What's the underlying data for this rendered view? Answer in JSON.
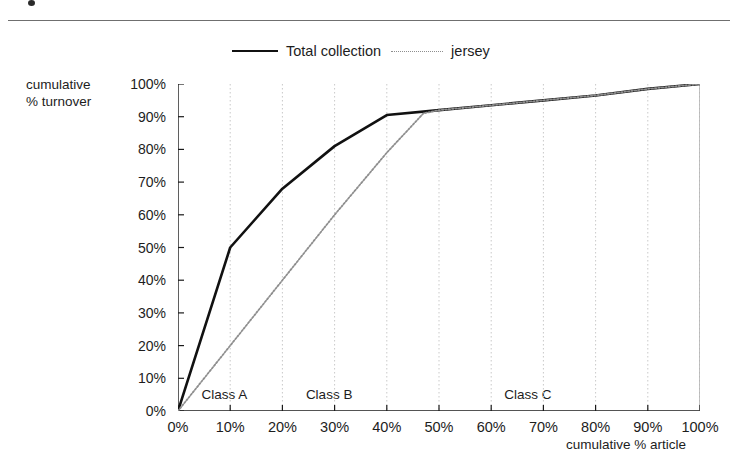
{
  "figure": {
    "ytitle_line1": "cumulative",
    "ytitle_line2": "% turnover",
    "xtitle": "cumulative % article"
  },
  "legend": {
    "items": [
      {
        "label": "Total collection",
        "style": "solid",
        "color": "#111111"
      },
      {
        "label": "jersey",
        "style": "dotted",
        "color": "#8e8e8e"
      }
    ]
  },
  "annotations": [
    {
      "label": "Class A",
      "x": 4.5,
      "y": 3
    },
    {
      "label": "Class B",
      "x": 24.5,
      "y": 3
    },
    {
      "label": "Class C",
      "x": 62.5,
      "y": 3
    }
  ],
  "chart_data": {
    "type": "line",
    "title": "",
    "xlabel": "cumulative % article",
    "ylabel": "cumulative % turnover",
    "xlim": [
      0,
      100
    ],
    "ylim": [
      0,
      100
    ],
    "xticks": [
      "0%",
      "10%",
      "20%",
      "30%",
      "40%",
      "50%",
      "60%",
      "70%",
      "80%",
      "90%",
      "100%"
    ],
    "yticks": [
      "0%",
      "10%",
      "20%",
      "30%",
      "40%",
      "50%",
      "60%",
      "70%",
      "80%",
      "90%",
      "100%"
    ],
    "xtick_values": [
      0,
      10,
      20,
      30,
      40,
      50,
      60,
      70,
      80,
      90,
      100
    ],
    "ytick_values": [
      0,
      10,
      20,
      30,
      40,
      50,
      60,
      70,
      80,
      90,
      100
    ],
    "grid": "vertical-dotted",
    "legend_position": "top-center",
    "series": [
      {
        "name": "Total collection",
        "style": "solid",
        "color": "#111111",
        "points": [
          {
            "x": 0,
            "y": 0
          },
          {
            "x": 10,
            "y": 50
          },
          {
            "x": 20,
            "y": 68
          },
          {
            "x": 30,
            "y": 81
          },
          {
            "x": 40,
            "y": 90.5
          },
          {
            "x": 50,
            "y": 92
          },
          {
            "x": 60,
            "y": 93.5
          },
          {
            "x": 70,
            "y": 95
          },
          {
            "x": 80,
            "y": 96.5
          },
          {
            "x": 90,
            "y": 98.5
          },
          {
            "x": 100,
            "y": 100
          }
        ]
      },
      {
        "name": "jersey",
        "style": "dotted",
        "color": "#8e8e8e",
        "points": [
          {
            "x": 0,
            "y": 0
          },
          {
            "x": 10,
            "y": 20
          },
          {
            "x": 20,
            "y": 40
          },
          {
            "x": 30,
            "y": 60
          },
          {
            "x": 40,
            "y": 79
          },
          {
            "x": 47,
            "y": 91
          },
          {
            "x": 50,
            "y": 92
          },
          {
            "x": 60,
            "y": 93.5
          },
          {
            "x": 70,
            "y": 95
          },
          {
            "x": 80,
            "y": 96.5
          },
          {
            "x": 90,
            "y": 98.5
          },
          {
            "x": 100,
            "y": 100
          }
        ]
      }
    ]
  }
}
